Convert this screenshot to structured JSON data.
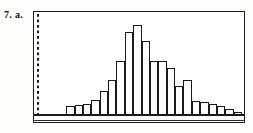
{
  "label": {
    "number": "7.",
    "part": "a."
  },
  "chart_data": {
    "type": "bar",
    "title": "",
    "subtitle": "",
    "xlabel": "",
    "ylabel": "",
    "grid": false,
    "legend": false,
    "axis_style": {
      "left_axis": "dotted",
      "bottom_axis": "solid",
      "frame": "rectangle"
    },
    "ylim": [
      0,
      100
    ],
    "xlim": [
      0,
      24
    ],
    "categories": [
      "1",
      "2",
      "3",
      "4",
      "5",
      "6",
      "7",
      "8",
      "9",
      "10",
      "11",
      "12",
      "13",
      "14",
      "15",
      "16",
      "17",
      "18",
      "19",
      "20",
      "21",
      "22",
      "23",
      "24"
    ],
    "values": [
      2,
      2,
      2,
      10,
      11,
      12,
      17,
      26,
      37,
      57,
      88,
      95,
      78,
      57,
      57,
      50,
      31,
      38,
      16,
      15,
      13,
      10,
      7,
      4
    ],
    "tick_labels_x": [],
    "tick_labels_y": [],
    "annotations": []
  },
  "colors": {
    "bar_fill": "#ffffff",
    "bar_stroke": "#1a1a1a",
    "frame": "#1a1a1a",
    "text": "#111111",
    "background": "#ffffff"
  }
}
